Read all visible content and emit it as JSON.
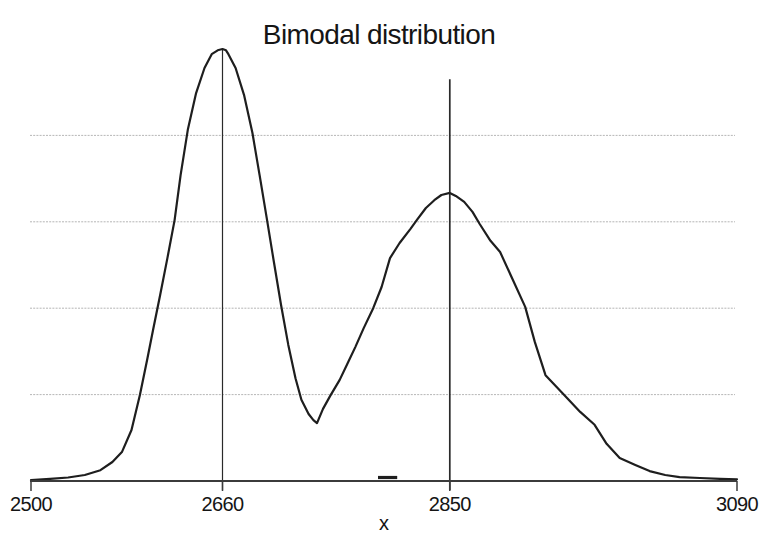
{
  "page": {
    "background": "#ffffff"
  },
  "chart_data": {
    "type": "line",
    "title": "Bimodal distribution",
    "xlabel": "x",
    "ylabel": "",
    "xlim": [
      2500,
      3090
    ],
    "ylim_relative": [
      0,
      1
    ],
    "x_ticks": [
      "2500",
      "2660",
      "2850",
      "3090"
    ],
    "x_tick_values": [
      2500,
      2660,
      2850,
      3090
    ],
    "gridline_levels": [
      0.2,
      0.4,
      0.6,
      0.8
    ],
    "grid_on": true,
    "legend": "none",
    "modes": [
      {
        "x": 2660,
        "relative_height": 1.0
      },
      {
        "x": 2850,
        "relative_height": 0.667
      }
    ],
    "valley": {
      "x": 2739,
      "relative_height": 0.134
    },
    "vertical_marker_lines": [
      {
        "x": 2660,
        "top": 1.0
      },
      {
        "x": 2850,
        "top": 0.93
      }
    ],
    "baseline_blip": {
      "x1": 2790,
      "x2": 2806,
      "relative_height": 0.008
    },
    "colors": {
      "curve": "#1e1e1e",
      "axis": "#3b3b3b",
      "grid": "#b3b3b3",
      "marker_line": "#2a2a2a",
      "text": "#151515"
    },
    "curve_points": [
      [
        2500,
        0.002
      ],
      [
        2516,
        0.005
      ],
      [
        2531,
        0.008
      ],
      [
        2545,
        0.014
      ],
      [
        2558,
        0.025
      ],
      [
        2568,
        0.044
      ],
      [
        2576,
        0.067
      ],
      [
        2584,
        0.118
      ],
      [
        2591,
        0.199
      ],
      [
        2597,
        0.28
      ],
      [
        2602,
        0.35
      ],
      [
        2608,
        0.431
      ],
      [
        2614,
        0.516
      ],
      [
        2620,
        0.604
      ],
      [
        2625,
        0.708
      ],
      [
        2631,
        0.813
      ],
      [
        2638,
        0.898
      ],
      [
        2645,
        0.956
      ],
      [
        2651,
        0.988
      ],
      [
        2656,
        0.997
      ],
      [
        2660,
        1.0
      ],
      [
        2663,
        0.997
      ],
      [
        2665,
        0.988
      ],
      [
        2671,
        0.956
      ],
      [
        2678,
        0.894
      ],
      [
        2685,
        0.806
      ],
      [
        2691,
        0.708
      ],
      [
        2697,
        0.609
      ],
      [
        2703,
        0.507
      ],
      [
        2709,
        0.407
      ],
      [
        2715,
        0.315
      ],
      [
        2721,
        0.238
      ],
      [
        2726,
        0.188
      ],
      [
        2732,
        0.155
      ],
      [
        2736,
        0.141
      ],
      [
        2739,
        0.134
      ],
      [
        2744,
        0.167
      ],
      [
        2750,
        0.197
      ],
      [
        2758,
        0.234
      ],
      [
        2765,
        0.275
      ],
      [
        2771,
        0.31
      ],
      [
        2778,
        0.354
      ],
      [
        2786,
        0.4
      ],
      [
        2793,
        0.449
      ],
      [
        2800,
        0.516
      ],
      [
        2808,
        0.551
      ],
      [
        2817,
        0.583
      ],
      [
        2823,
        0.606
      ],
      [
        2830,
        0.632
      ],
      [
        2837,
        0.65
      ],
      [
        2843,
        0.662
      ],
      [
        2850,
        0.667
      ],
      [
        2855,
        0.66
      ],
      [
        2862,
        0.646
      ],
      [
        2869,
        0.623
      ],
      [
        2875,
        0.595
      ],
      [
        2884,
        0.556
      ],
      [
        2892,
        0.53
      ],
      [
        2902,
        0.47
      ],
      [
        2913,
        0.403
      ],
      [
        2921,
        0.322
      ],
      [
        2930,
        0.245
      ],
      [
        2945,
        0.201
      ],
      [
        2959,
        0.16
      ],
      [
        2971,
        0.13
      ],
      [
        2981,
        0.086
      ],
      [
        2992,
        0.053
      ],
      [
        3005,
        0.037
      ],
      [
        3017,
        0.023
      ],
      [
        3030,
        0.014
      ],
      [
        3042,
        0.009
      ],
      [
        3059,
        0.007
      ],
      [
        3076,
        0.005
      ],
      [
        3090,
        0.004
      ]
    ]
  }
}
